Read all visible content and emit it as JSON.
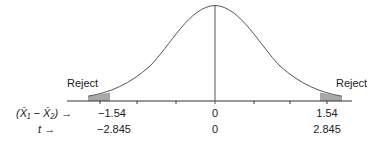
{
  "diagram": {
    "type": "normal-distribution-two-tailed-test",
    "reject_left_label": "Reject",
    "reject_right_label": "Reject",
    "row_labels": {
      "diff": "(X̄₁ − X̄₂)",
      "t": "t"
    },
    "arrow": "→",
    "diff_values": {
      "left": "−1.54",
      "center": "0",
      "right": "1.54"
    },
    "t_values": {
      "left": "−2.845",
      "center": "0",
      "right": "2.845"
    },
    "colors": {
      "curve": "#555555",
      "shade": "#a8a8a8",
      "axis": "#333333"
    }
  }
}
